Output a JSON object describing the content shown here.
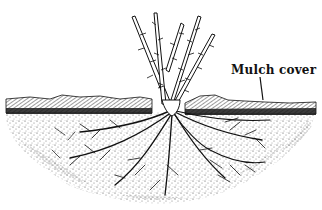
{
  "figure": {
    "labels": [
      {
        "id": "mulch",
        "text": "Mulch cover",
        "x": 231,
        "y": 63
      }
    ],
    "colors": {
      "ink": "#111111",
      "background": "#ffffff",
      "soil_stipple": "#555555"
    }
  }
}
